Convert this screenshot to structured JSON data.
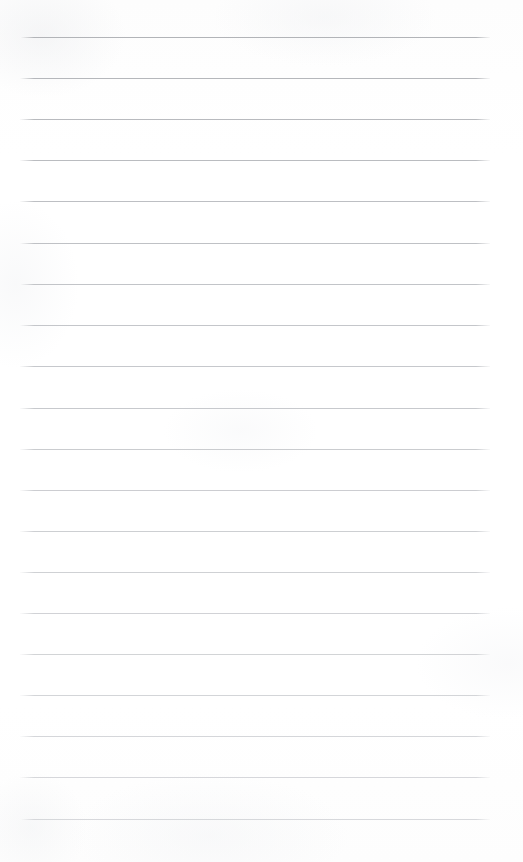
{
  "document": {
    "kind": "scanned-blank-lined-paper",
    "page_width": 523,
    "page_height": 862,
    "background_color": "#ffffff",
    "rule_color": "#bcbec1",
    "rule_count": 20,
    "rule_thickness": 1,
    "rule_left_x": 20,
    "rule_right_x": 490,
    "rule_spacing": 41,
    "first_rule_y": 37,
    "last_rule_y": 819,
    "text_content": "",
    "header_text": "",
    "footer_text": "",
    "margin_rule": false,
    "rules": [
      {
        "index": 1,
        "y": 37,
        "x1": 20,
        "x2": 490,
        "color": "#b2b4b8",
        "opacity": 1.0,
        "text": ""
      },
      {
        "index": 2,
        "y": 78,
        "x1": 20,
        "x2": 490,
        "color": "#b4b6ba",
        "opacity": 0.98,
        "text": ""
      },
      {
        "index": 3,
        "y": 119,
        "x1": 20,
        "x2": 490,
        "color": "#b6b8bc",
        "opacity": 0.97,
        "text": ""
      },
      {
        "index": 4,
        "y": 160,
        "x1": 20,
        "x2": 490,
        "color": "#b8babe",
        "opacity": 0.96,
        "text": ""
      },
      {
        "index": 5,
        "y": 201,
        "x1": 20,
        "x2": 490,
        "color": "#babcc0",
        "opacity": 0.95,
        "text": ""
      },
      {
        "index": 6,
        "y": 243,
        "x1": 20,
        "x2": 490,
        "color": "#bcbec2",
        "opacity": 0.94,
        "text": ""
      },
      {
        "index": 7,
        "y": 284,
        "x1": 20,
        "x2": 490,
        "color": "#bec0c4",
        "opacity": 0.93,
        "text": ""
      },
      {
        "index": 8,
        "y": 325,
        "x1": 20,
        "x2": 490,
        "color": "#c0c2c6",
        "opacity": 0.92,
        "text": ""
      },
      {
        "index": 9,
        "y": 366,
        "x1": 20,
        "x2": 490,
        "color": "#c1c3c7",
        "opacity": 0.91,
        "text": ""
      },
      {
        "index": 10,
        "y": 408,
        "x1": 20,
        "x2": 490,
        "color": "#c2c4c8",
        "opacity": 0.9,
        "text": ""
      },
      {
        "index": 11,
        "y": 449,
        "x1": 20,
        "x2": 490,
        "color": "#c4c6ca",
        "opacity": 0.89,
        "text": ""
      },
      {
        "index": 12,
        "y": 490,
        "x1": 20,
        "x2": 490,
        "color": "#c5c7cb",
        "opacity": 0.88,
        "text": ""
      },
      {
        "index": 13,
        "y": 531,
        "x1": 20,
        "x2": 490,
        "color": "#c6c8cc",
        "opacity": 0.87,
        "text": ""
      },
      {
        "index": 14,
        "y": 572,
        "x1": 20,
        "x2": 490,
        "color": "#c8cace",
        "opacity": 0.86,
        "text": ""
      },
      {
        "index": 15,
        "y": 613,
        "x1": 20,
        "x2": 490,
        "color": "#c9cbcf",
        "opacity": 0.85,
        "text": ""
      },
      {
        "index": 16,
        "y": 654,
        "x1": 20,
        "x2": 490,
        "color": "#cacccf",
        "opacity": 0.84,
        "text": ""
      },
      {
        "index": 17,
        "y": 695,
        "x1": 20,
        "x2": 490,
        "color": "#cbcdd1",
        "opacity": 0.83,
        "text": ""
      },
      {
        "index": 18,
        "y": 736,
        "x1": 20,
        "x2": 490,
        "color": "#ccced2",
        "opacity": 0.82,
        "text": ""
      },
      {
        "index": 19,
        "y": 777,
        "x1": 20,
        "x2": 490,
        "color": "#cdcfd3",
        "opacity": 0.81,
        "text": ""
      },
      {
        "index": 20,
        "y": 819,
        "x1": 20,
        "x2": 490,
        "color": "#ced0d4",
        "opacity": 0.8,
        "text": ""
      }
    ]
  }
}
